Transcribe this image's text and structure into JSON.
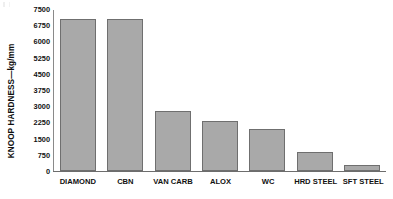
{
  "chart_data": {
    "type": "bar",
    "title": "",
    "subtitle": "",
    "xlabel": "",
    "ylabel": "KNOOP HARDNESS—kg/mm",
    "categories": [
      "DIAMOND",
      "CBN",
      "VAN CARB",
      "ALOX",
      "WC",
      "HRD STEEL",
      "SFT STEEL"
    ],
    "values": [
      7000,
      7000,
      2750,
      2300,
      1950,
      875,
      250
    ],
    "ylim": [
      0,
      7500
    ],
    "yticks": [
      0,
      750,
      1500,
      2250,
      3000,
      3750,
      4500,
      5250,
      6000,
      6750,
      7500
    ],
    "ytick_labels": [
      "0",
      "750",
      "1500",
      "2250",
      "3000",
      "3750",
      "4500",
      "5250",
      "6000",
      "6750",
      "7500"
    ],
    "grid": false,
    "legend": null,
    "legend_position": "none",
    "bar_color": "#a9a9a9",
    "bar_edge_color": "#6f6f6f",
    "axis_color": "#6d6d6d",
    "background_color": "#ffffff",
    "text_color": "#111111"
  }
}
